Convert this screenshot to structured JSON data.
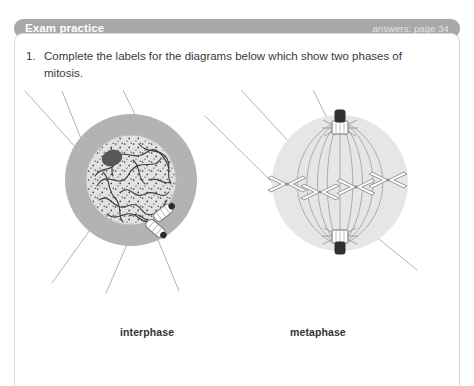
{
  "header": {
    "title": "Exam practice",
    "answers_note": "answers: page 34",
    "bar_color": "#a8a8a8",
    "title_color": "#ffffff"
  },
  "question": {
    "number": "1.",
    "text": "Complete the labels for the diagrams below which show two phases of mitosis."
  },
  "figures": [
    {
      "id": "interphase",
      "caption": "interphase",
      "description": "Animal cell in interphase: cytoplasm ring, nucleus with nucleolus, tangled chromatin threads, ribosome stipple and a pair of centrioles",
      "leader_lines": 6,
      "parts": [
        "cytoplasm",
        "nuclear membrane",
        "nucleolus",
        "chromatin",
        "centrioles",
        "cell membrane"
      ],
      "colors": {
        "cytoplasm": "#b3b3b3",
        "nucleus": "#e0e0e0",
        "nucleolus": "#555555",
        "chromatin": "#4a4a4a",
        "stipple": "#3c3c3c"
      }
    },
    {
      "id": "metaphase",
      "caption": "metaphase",
      "description": "Animal cell in metaphase: spindle fibres from two centriole poles with four X-shaped chromosomes lined up on the equator",
      "leader_lines": 4,
      "parts": [
        "spindle fibre",
        "chromosome",
        "centriole",
        "equator"
      ],
      "colors": {
        "cell": "#e6e6e6",
        "spindle": "#9a9a9a",
        "chromosome": "#8a8a8a",
        "centriole": "#2f2f2f"
      }
    }
  ],
  "panel": {
    "background": "#ffffff",
    "border_color": "#d8d8d8"
  },
  "leader_line_color": "#9e9e9e"
}
